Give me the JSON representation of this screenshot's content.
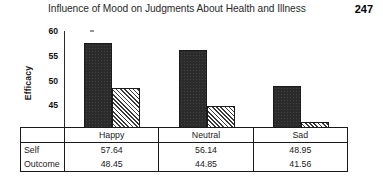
{
  "header": {
    "title": "Influence of Mood on Judgments About Health and Illness",
    "page_number": "247"
  },
  "chart_data": {
    "type": "bar",
    "title": "Influence of Mood on Judgments About Health and Illness",
    "xlabel": "",
    "ylabel": "Efficacy",
    "categories": [
      "Happy",
      "Neutral",
      "Sad"
    ],
    "series": [
      {
        "name": "Self",
        "values": [
          57.64,
          56.14,
          48.95
        ]
      },
      {
        "name": "Outcome",
        "values": [
          48.45,
          44.85,
          41.56
        ]
      }
    ],
    "ylim": [
      40,
      60
    ],
    "yticks": [
      "40",
      "45",
      "50",
      "55",
      "60"
    ],
    "grid": false,
    "legend": "none",
    "series_styles": [
      "solid-dark",
      "diagonal-hatch"
    ]
  },
  "table": {
    "row_label_header": "",
    "column_headers": [
      "Happy",
      "Neutral",
      "Sad"
    ],
    "rows": [
      {
        "label": "Self",
        "values": [
          "57.64",
          "56.14",
          "48.95"
        ]
      },
      {
        "label": "Outcome",
        "values": [
          "48.45",
          "44.85",
          "41.56"
        ]
      }
    ]
  }
}
